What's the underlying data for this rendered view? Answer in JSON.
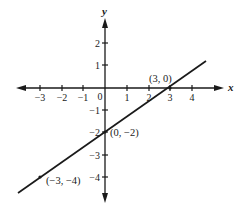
{
  "diagram": {
    "type": "coordinate-plane-line",
    "axes": {
      "x_label": "x",
      "y_label": "y",
      "x_ticks": [
        {
          "value": -3,
          "label": "−3"
        },
        {
          "value": -2,
          "label": "−2"
        },
        {
          "value": -1,
          "label": "−1"
        },
        {
          "value": 1,
          "label": "1"
        },
        {
          "value": 2,
          "label": "2"
        },
        {
          "value": 3,
          "label": "3"
        },
        {
          "value": 4,
          "label": "4"
        }
      ],
      "y_ticks": [
        {
          "value": 2,
          "label": "2"
        },
        {
          "value": 1,
          "label": "1"
        },
        {
          "value": -1,
          "label": "−1"
        },
        {
          "value": -2,
          "label": "−2"
        },
        {
          "value": -3,
          "label": "−3"
        },
        {
          "value": -4,
          "label": "−4"
        }
      ],
      "origin_label": "0"
    },
    "line": {
      "equation": "y = (2/3)x − 2",
      "color": "#1a1a1a"
    },
    "points": [
      {
        "x": 3,
        "y": 0,
        "label": "(3, 0)"
      },
      {
        "x": 0,
        "y": -2,
        "label": "(0, −2)"
      },
      {
        "x": -3,
        "y": -4,
        "label": "(−3, −4)"
      }
    ]
  }
}
